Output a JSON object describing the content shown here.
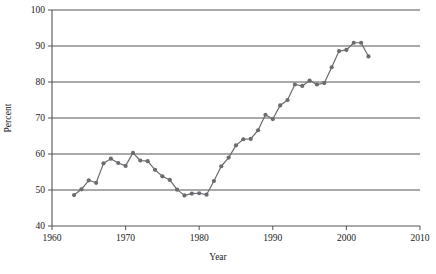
{
  "chart_data": {
    "type": "line",
    "title": "",
    "xlabel": "Year",
    "ylabel": "Percent",
    "xlim": [
      1960,
      2010
    ],
    "ylim": [
      40,
      100
    ],
    "xticks": [
      1960,
      1970,
      1980,
      1990,
      2000,
      2010
    ],
    "yticks": [
      40,
      50,
      60,
      70,
      80,
      90,
      100
    ],
    "grid": "horizontal",
    "legend": "none",
    "markers": "filled-circle",
    "series_color": "#6b6b70",
    "axis_color": "#555555",
    "x": [
      1963,
      1964,
      1965,
      1966,
      1967,
      1968,
      1969,
      1970,
      1971,
      1972,
      1973,
      1974,
      1975,
      1976,
      1977,
      1978,
      1979,
      1980,
      1981,
      1982,
      1983,
      1984,
      1985,
      1986,
      1987,
      1988,
      1989,
      1990,
      1991,
      1992,
      1993,
      1994,
      1995,
      1996,
      1997,
      1998,
      1999,
      2000,
      2001,
      2002,
      2003
    ],
    "values": [
      48.6,
      50.2,
      52.7,
      52.0,
      57.4,
      58.7,
      57.5,
      56.7,
      60.3,
      58.2,
      58.0,
      55.6,
      53.8,
      52.8,
      50.1,
      48.5,
      49.0,
      49.1,
      48.7,
      52.5,
      56.6,
      59.0,
      62.4,
      64.1,
      64.2,
      66.6,
      70.9,
      69.7,
      73.5,
      75.0,
      79.3,
      78.9,
      80.4,
      79.3,
      79.7,
      84.1,
      88.6,
      88.9,
      90.9,
      90.9,
      87.1
    ],
    "series": [
      {
        "name": "Percent",
        "values": [
          48.6,
          50.2,
          52.7,
          52.0,
          57.4,
          58.7,
          57.5,
          56.7,
          60.3,
          58.2,
          58.0,
          55.6,
          53.8,
          52.8,
          50.1,
          48.5,
          49.0,
          49.1,
          48.7,
          52.5,
          56.6,
          59.0,
          62.4,
          64.1,
          64.2,
          66.6,
          70.9,
          69.7,
          73.5,
          75.0,
          79.3,
          78.9,
          80.4,
          79.3,
          79.7,
          84.1,
          88.6,
          88.9,
          90.9,
          90.9,
          87.1
        ]
      }
    ]
  }
}
